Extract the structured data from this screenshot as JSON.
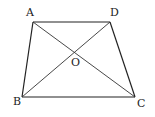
{
  "figure": {
    "points": {
      "A": {
        "label": "A",
        "x": 33,
        "y": 22,
        "lx": 26,
        "ly": 16
      },
      "D": {
        "label": "D",
        "x": 110,
        "y": 22,
        "lx": 110,
        "ly": 16
      },
      "B": {
        "label": "B",
        "x": 22,
        "y": 97,
        "lx": 13,
        "ly": 105
      },
      "C": {
        "label": "C",
        "x": 135,
        "y": 97,
        "lx": 137,
        "ly": 107
      },
      "O": {
        "label": "O",
        "x": 74,
        "y": 50,
        "lx": 71,
        "ly": 66
      }
    },
    "segments": [
      {
        "from": "A",
        "to": "D",
        "type": "side"
      },
      {
        "from": "D",
        "to": "C",
        "type": "side"
      },
      {
        "from": "C",
        "to": "B",
        "type": "side"
      },
      {
        "from": "B",
        "to": "A",
        "type": "side"
      },
      {
        "from": "A",
        "to": "C",
        "type": "diagonal"
      },
      {
        "from": "B",
        "to": "D",
        "type": "diagonal"
      }
    ],
    "colors": {
      "stroke": "#222222",
      "background": "#ffffff"
    }
  }
}
